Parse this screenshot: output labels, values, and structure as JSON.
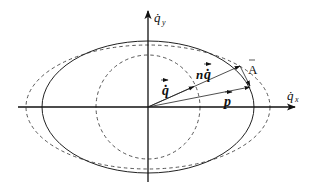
{
  "diagram": {
    "type": "vector-diagram",
    "axes": {
      "x_label": "q̇",
      "x_subscript": "x",
      "y_label": "q̇",
      "y_subscript": "y"
    },
    "curves": [
      {
        "name": "solid-ellipse",
        "style": "solid",
        "cx": 148,
        "cy": 107,
        "rx": 106,
        "ry": 66
      },
      {
        "name": "outer-dashed-ellipse",
        "style": "dashed",
        "cx": 148,
        "cy": 107,
        "rx": 122,
        "ry": 62
      },
      {
        "name": "inner-dashed-circle",
        "style": "dashed",
        "cx": 148,
        "cy": 107,
        "rx": 52,
        "ry": 52
      }
    ],
    "vectors": [
      {
        "name": "q-dot",
        "label": "q̇",
        "from": [
          148,
          107
        ],
        "to": [
          194,
          87
        ]
      },
      {
        "name": "n-q-dot",
        "label": "nq̇",
        "from": [
          148,
          107
        ],
        "to": [
          240,
          66
        ]
      },
      {
        "name": "p",
        "label": "p",
        "from": [
          148,
          107
        ],
        "to": [
          250,
          87
        ]
      },
      {
        "name": "A",
        "label": "A",
        "from": [
          240,
          66
        ],
        "to": [
          250,
          87
        ]
      }
    ],
    "labels": {
      "q_dot": "q̇",
      "n_q_dot_n": "n",
      "n_q_dot_q": "q̇",
      "p": "p",
      "A": "A"
    },
    "colors": {
      "line": "#1a1a1a",
      "dashed": "#333333",
      "background": "#ffffff"
    }
  }
}
